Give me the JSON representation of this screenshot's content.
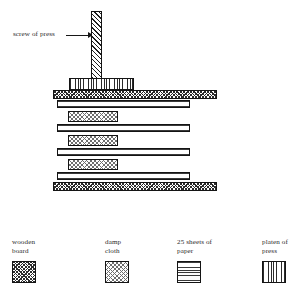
{
  "diagram": {
    "callout": {
      "label": "screw of press",
      "arrow": "arrow-right"
    },
    "stack": {
      "description": "Alternating wooden boards, damp cloths and paper stacks compressed between press platen and base board",
      "layers": [
        {
          "material": "platen of press",
          "pattern": "vertical-lines"
        },
        {
          "material": "wooden board",
          "pattern": "cross-hatch"
        },
        {
          "material": "25 sheets of paper",
          "pattern": "horizontal-lines"
        },
        {
          "material": "damp cloth",
          "pattern": "checker"
        },
        {
          "material": "25 sheets of paper",
          "pattern": "horizontal-lines"
        },
        {
          "material": "damp cloth",
          "pattern": "checker"
        },
        {
          "material": "25 sheets of paper",
          "pattern": "horizontal-lines"
        },
        {
          "material": "damp cloth",
          "pattern": "checker"
        },
        {
          "material": "25 sheets of paper",
          "pattern": "horizontal-lines"
        },
        {
          "material": "wooden board",
          "pattern": "cross-hatch"
        }
      ]
    }
  },
  "legend": {
    "items": [
      {
        "label": "wooden\nboard",
        "pattern": "cross-hatch"
      },
      {
        "label": "damp\ncloth",
        "pattern": "checker"
      },
      {
        "label": "25 sheets of\npaper",
        "pattern": "horizontal-lines"
      },
      {
        "label": "platen of\npress",
        "pattern": "vertical-lines"
      }
    ]
  },
  "colors": {
    "ink": "#141414",
    "text": "#2a2a2a",
    "background": "#ffffff"
  }
}
